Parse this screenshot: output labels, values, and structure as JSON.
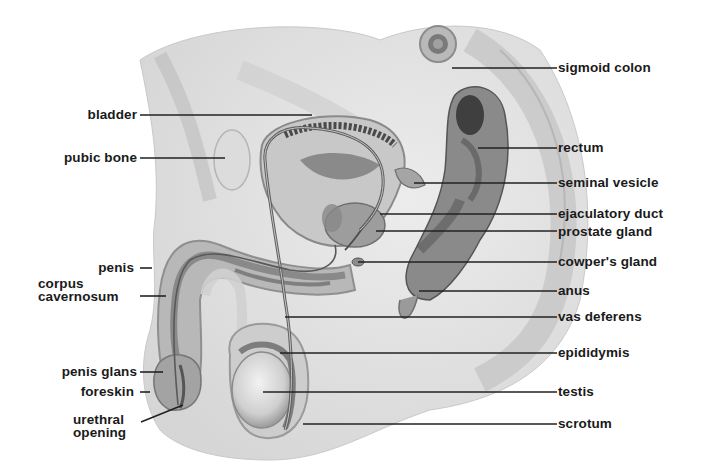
{
  "diagram": {
    "colors": {
      "background": "#ffffff",
      "label_text": "#1a1a1a",
      "leader_line": "#222222",
      "tissue_light": "#e4e4e4",
      "tissue_mid": "#bdbdbd",
      "tissue_dark": "#6f6f6f"
    },
    "labels_left": [
      {
        "id": "bladder",
        "text": "bladder"
      },
      {
        "id": "pubic-bone",
        "text": "pubic bone"
      },
      {
        "id": "penis",
        "text": "penis"
      },
      {
        "id": "corpus-cavernosum",
        "line1": "corpus",
        "line2": "cavernosum"
      },
      {
        "id": "penis-glans",
        "text": "penis glans"
      },
      {
        "id": "foreskin",
        "text": "foreskin"
      },
      {
        "id": "urethral-opening",
        "line1": "urethral",
        "line2": "opening"
      }
    ],
    "labels_right": [
      {
        "id": "sigmoid-colon",
        "text": "sigmoid colon"
      },
      {
        "id": "rectum",
        "text": "rectum"
      },
      {
        "id": "seminal-vesicle",
        "text": "seminal vesicle"
      },
      {
        "id": "ejaculatory-duct",
        "text": "ejaculatory duct"
      },
      {
        "id": "prostate-gland",
        "text": "prostate gland"
      },
      {
        "id": "cowpers-gland",
        "text": "cowper's gland"
      },
      {
        "id": "anus",
        "text": "anus"
      },
      {
        "id": "vas-deferens",
        "text": "vas deferens"
      },
      {
        "id": "epididymis",
        "text": "epididymis"
      },
      {
        "id": "testis",
        "text": "testis"
      },
      {
        "id": "scrotum",
        "text": "scrotum"
      }
    ]
  }
}
